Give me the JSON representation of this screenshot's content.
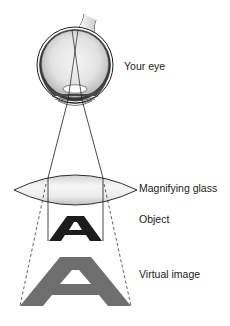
{
  "labels": {
    "eye": "Your eye",
    "magnifying_glass": "Magnifying glass",
    "object": "Object",
    "virtual_image": "Virtual image"
  },
  "letters": {
    "object": "A",
    "virtual_image": "A"
  },
  "colors": {
    "outline": "#1a1a1a",
    "object_letter": "#1c1c1c",
    "virtual_letter": "#6e6e6e",
    "lens_fill_center": "#f7f7f7",
    "lens_fill_edge": "#c4c4c4",
    "eye_fill_center": "#f2f2f2",
    "eye_fill_edge": "#bdbdbd",
    "dashed_line": "#333333"
  }
}
